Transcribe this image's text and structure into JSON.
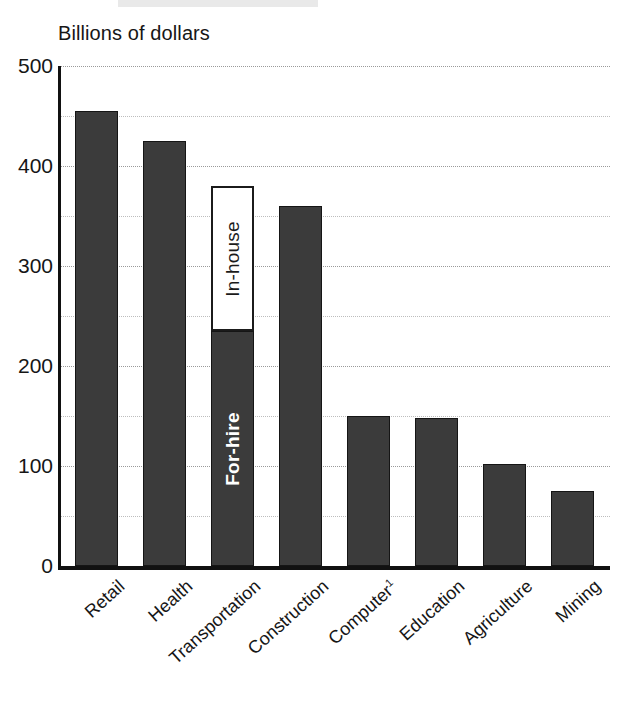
{
  "chart_data": {
    "type": "bar",
    "title": "Billions of dollars",
    "xlabel": "",
    "ylabel": "Billions of dollars",
    "ylim": [
      0,
      500
    ],
    "yticks": [
      500,
      400,
      300,
      200,
      100,
      0
    ],
    "ytick_labels": [
      "500",
      "400",
      "300",
      "200",
      "100",
      "0"
    ],
    "minor_gridlines": [
      450,
      350,
      250,
      150,
      50
    ],
    "grid": true,
    "legend_position": "in-bar-annotations",
    "categories": [
      "Retail",
      "Health",
      "Transportation",
      "Construction",
      "Computer¹",
      "Education",
      "Agriculture",
      "Mining"
    ],
    "values": [
      455,
      425,
      380,
      360,
      150,
      148,
      102,
      75
    ],
    "stacked_detail": {
      "category": "Transportation",
      "segments": [
        {
          "name": "For-hire",
          "value": 235,
          "style": "filled"
        },
        {
          "name": "In-house",
          "value": 145,
          "style": "open"
        }
      ],
      "total": 380
    },
    "annotations": [
      {
        "text": "In-house",
        "target": "Transportation",
        "orientation": "vertical",
        "color": "#1b1b1b"
      },
      {
        "text": "For-hire",
        "target": "Transportation",
        "orientation": "vertical",
        "color": "#ffffff"
      }
    ],
    "colors": {
      "bar_fill": "#3b3b3b",
      "bar_stroke": "#151515",
      "open_fill": "#ffffff",
      "axis": "#111111",
      "gridline": "#9a9a9a",
      "text": "#161616",
      "background": "#ffffff"
    }
  },
  "bars": [
    {
      "label": "Retail",
      "value": 455,
      "style": "filled",
      "segments": [
        {
          "name": "Retail",
          "value": 455,
          "style": "filled",
          "label": ""
        }
      ]
    },
    {
      "label": "Health",
      "value": 425,
      "style": "filled",
      "segments": [
        {
          "name": "Health",
          "value": 425,
          "style": "filled",
          "label": ""
        }
      ]
    },
    {
      "label": "Transportation",
      "value": 380,
      "style": "stacked",
      "segments": [
        {
          "name": "For-hire",
          "value": 235,
          "style": "filled",
          "label": "For-hire"
        },
        {
          "name": "In-house",
          "value": 145,
          "style": "open",
          "label": "In-house"
        }
      ]
    },
    {
      "label": "Construction",
      "value": 360,
      "style": "filled",
      "segments": [
        {
          "name": "Construction",
          "value": 360,
          "style": "filled",
          "label": ""
        }
      ]
    },
    {
      "label": "Computer¹",
      "value": 150,
      "style": "filled",
      "segments": [
        {
          "name": "Computer",
          "value": 150,
          "style": "filled",
          "label": ""
        }
      ]
    },
    {
      "label": "Education",
      "value": 148,
      "style": "filled",
      "segments": [
        {
          "name": "Education",
          "value": 148,
          "style": "filled",
          "label": ""
        }
      ]
    },
    {
      "label": "Agriculture",
      "value": 102,
      "style": "filled",
      "segments": [
        {
          "name": "Agriculture",
          "value": 102,
          "style": "filled",
          "label": ""
        }
      ]
    },
    {
      "label": "Mining",
      "value": 75,
      "style": "filled",
      "segments": [
        {
          "name": "Mining",
          "value": 75,
          "style": "filled",
          "label": ""
        }
      ]
    }
  ],
  "axis": {
    "title": "Billions of dollars",
    "y_max": 500,
    "y_min": 0,
    "major_step": 100,
    "minor_step": 50
  },
  "x_labels": [
    {
      "text": "Retail",
      "sup": ""
    },
    {
      "text": "Health",
      "sup": ""
    },
    {
      "text": "Transportation",
      "sup": ""
    },
    {
      "text": "Construction",
      "sup": ""
    },
    {
      "text": "Computer",
      "sup": "1"
    },
    {
      "text": "Education",
      "sup": ""
    },
    {
      "text": "Agriculture",
      "sup": ""
    },
    {
      "text": "Mining",
      "sup": ""
    }
  ]
}
